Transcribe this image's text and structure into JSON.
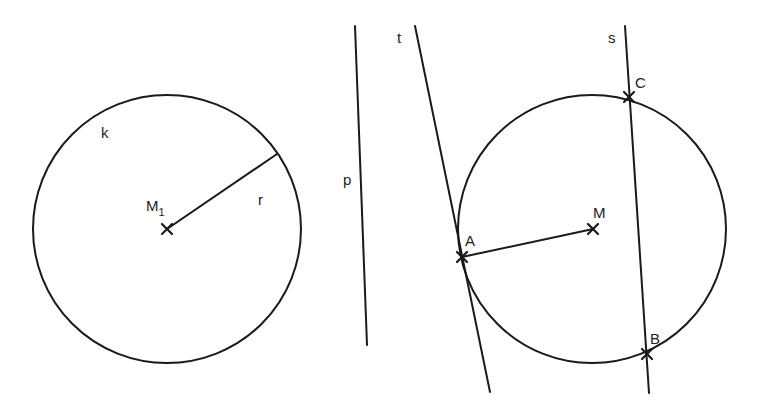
{
  "diagram": {
    "style": {
      "stroke_color": "#1a1a1a",
      "background": "#ffffff"
    },
    "left_figure": {
      "circle": {
        "label": "k",
        "cx": 167,
        "cy": 229,
        "r": 134,
        "label_x": 101,
        "label_y": 138
      },
      "center": {
        "label": "M",
        "subscript": "1",
        "x": 167,
        "y": 229,
        "label_x": 146,
        "label_y": 211
      },
      "radius": {
        "label": "r",
        "x1": 167,
        "y1": 229,
        "x2": 277,
        "y2": 154,
        "label_x": 258,
        "label_y": 205
      }
    },
    "line_p": {
      "label": "p",
      "x1": 355,
      "y1": 26,
      "x2": 367,
      "y2": 345,
      "label_x": 343,
      "label_y": 185
    },
    "right_figure": {
      "circle": {
        "cx": 592,
        "cy": 229,
        "r": 134
      },
      "center": {
        "label": "M",
        "x": 593,
        "y": 229,
        "label_x": 593,
        "label_y": 218
      },
      "point_a": {
        "label": "A",
        "x": 462,
        "y": 257,
        "label_x": 465,
        "label_y": 246
      },
      "segment_am": {
        "x1": 462,
        "y1": 257,
        "x2": 593,
        "y2": 229
      },
      "tangent_t": {
        "label": "t",
        "x1": 415,
        "y1": 26,
        "x2": 490,
        "y2": 392,
        "label_x": 397,
        "label_y": 43
      },
      "secant_s": {
        "label": "s",
        "x1": 625,
        "y1": 26,
        "x2": 649,
        "y2": 393,
        "label_x": 608,
        "label_y": 43
      },
      "point_c": {
        "label": "C",
        "x": 629,
        "y": 97,
        "label_x": 635,
        "label_y": 88
      },
      "point_b": {
        "label": "B",
        "x": 647,
        "y": 354,
        "label_x": 650,
        "label_y": 344
      }
    }
  }
}
